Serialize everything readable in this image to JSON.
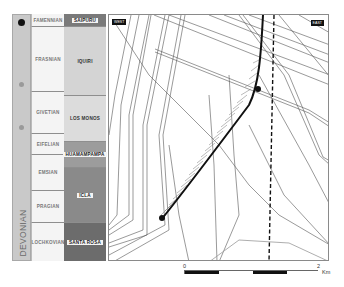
{
  "stratigraphic_column": {
    "era": "DEVONIAN",
    "stages": [
      {
        "name": "FAMENNIAN",
        "top": 14,
        "bottom": 27
      },
      {
        "name": "FRASNIAN",
        "top": 27,
        "bottom": 92
      },
      {
        "name": "GIVETIAN",
        "top": 92,
        "bottom": 134
      },
      {
        "name": "EIFELIAN",
        "top": 134,
        "bottom": 155
      },
      {
        "name": "EMSIAN",
        "top": 155,
        "bottom": 191
      },
      {
        "name": "PRAGIAN",
        "top": 191,
        "bottom": 223
      },
      {
        "name": "LOCHKOVIAN",
        "top": 223,
        "bottom": 261
      }
    ],
    "formations": [
      {
        "name": "SAIPURU",
        "top": 14,
        "bottom": 27,
        "color": "#7a7a7a"
      },
      {
        "name": "IQUIRI",
        "top": 27,
        "bottom": 96,
        "color": "#d4d4d4"
      },
      {
        "name": "LOS MONOS",
        "top": 96,
        "bottom": 142,
        "color": "#dcdcdc"
      },
      {
        "name": "HUAMAMPAMPA",
        "top": 142,
        "bottom": 168,
        "color": "#9c9c9c"
      },
      {
        "name": "ICLA",
        "top": 168,
        "bottom": 223,
        "color": "#8a8a8a"
      },
      {
        "name": "SANTA ROSA",
        "top": 223,
        "bottom": 261,
        "color": "#6c6c6c"
      }
    ],
    "markers": [
      {
        "type": "black-dot",
        "y": 21
      },
      {
        "type": "grey-dot",
        "y": 83
      },
      {
        "type": "grey-dot",
        "y": 126
      }
    ]
  },
  "map": {
    "west_label": "WEST",
    "east_label": "EAST"
  },
  "scale_bar": {
    "start_label": "0",
    "end_label": "2",
    "unit": "Km"
  }
}
